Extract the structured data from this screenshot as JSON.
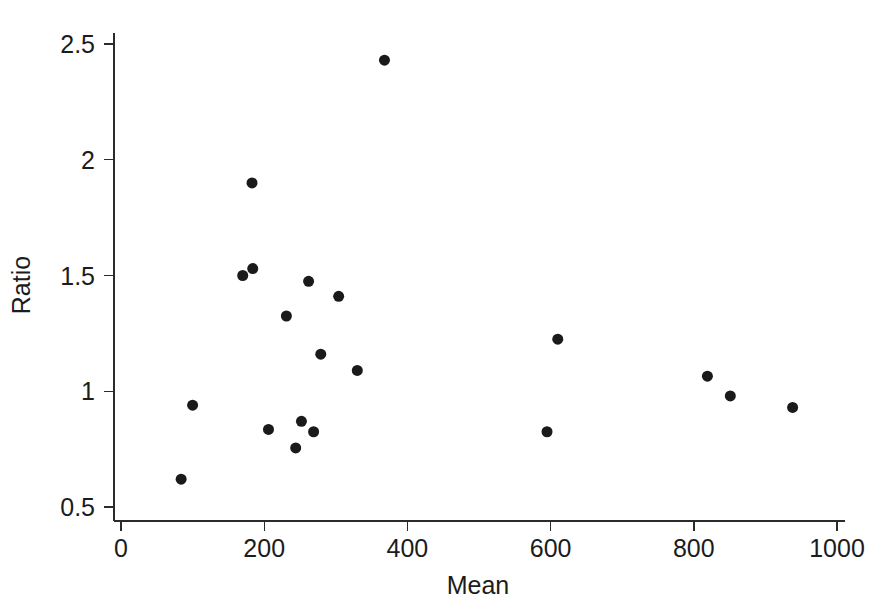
{
  "chart_data": {
    "type": "scatter",
    "title": "",
    "xlabel": "Mean",
    "ylabel": "Ratio",
    "xlim": [
      0,
      1000
    ],
    "ylim": [
      0.5,
      2.5
    ],
    "xticks": [
      0,
      200,
      400,
      600,
      800,
      1000
    ],
    "xtick_labels": [
      "0",
      "200",
      "400",
      "600",
      "800",
      "1000"
    ],
    "yticks": [
      0.5,
      1,
      1.5,
      2,
      2.5
    ],
    "ytick_labels": [
      "0.5",
      "1",
      "1.5",
      "2",
      "2.5"
    ],
    "grid": false,
    "legend": null,
    "marker": {
      "shape": "circle",
      "color": "#1a1a1a",
      "size_px": 11
    },
    "series": [
      {
        "name": "Ratio vs Mean",
        "points": [
          {
            "x": 84,
            "y": 0.62
          },
          {
            "x": 100,
            "y": 0.94
          },
          {
            "x": 170,
            "y": 1.5
          },
          {
            "x": 184,
            "y": 1.53
          },
          {
            "x": 183,
            "y": 1.9
          },
          {
            "x": 206,
            "y": 0.835
          },
          {
            "x": 231,
            "y": 1.325
          },
          {
            "x": 244,
            "y": 0.755
          },
          {
            "x": 252,
            "y": 0.87
          },
          {
            "x": 262,
            "y": 1.475
          },
          {
            "x": 269,
            "y": 0.825
          },
          {
            "x": 279,
            "y": 1.16
          },
          {
            "x": 304,
            "y": 1.41
          },
          {
            "x": 330,
            "y": 1.09
          },
          {
            "x": 368,
            "y": 2.43
          },
          {
            "x": 595,
            "y": 0.825
          },
          {
            "x": 610,
            "y": 1.225
          },
          {
            "x": 819,
            "y": 1.065
          },
          {
            "x": 851,
            "y": 0.98
          },
          {
            "x": 938,
            "y": 0.93
          }
        ]
      }
    ]
  },
  "geometry": {
    "plot_left_px": 121,
    "plot_right_px": 837,
    "axis_right_end_px": 845,
    "axis_top_end_px": 33,
    "baseline_y_px": 521,
    "y_top_px": 44,
    "y_bottom_px": 507
  }
}
